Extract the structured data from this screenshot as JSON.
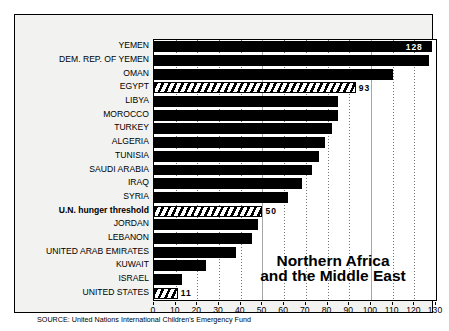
{
  "chart_data": {
    "type": "bar",
    "orientation": "horizontal",
    "title": "Northern Africa and the Middle East",
    "title_line1": "Northern Africa",
    "title_line2": "and the Middle East",
    "xlabel": "",
    "ylabel": "",
    "xlim": [
      0,
      130
    ],
    "xticks": [
      0,
      10,
      20,
      30,
      40,
      50,
      60,
      70,
      80,
      90,
      100,
      110,
      120,
      130
    ],
    "xtick_labels": [
      "0",
      "10",
      "20",
      "30",
      "40",
      "50",
      "60",
      "70",
      "80",
      "90",
      "100",
      "110",
      "120",
      "130"
    ],
    "grid": true,
    "legend": "none",
    "categories": [
      "YEMEN",
      "DEM. REP. OF YEMEN",
      "OMAN",
      "EGYPT",
      "LIBYA",
      "MOROCCO",
      "TURKEY",
      "ALGERIA",
      "TUNISIA",
      "SAUDI ARABIA",
      "IRAQ",
      "SYRIA",
      "U.N. hunger threshold",
      "JORDAN",
      "LEBANON",
      "UNITED ARAB EMIRATES",
      "KUWAIT",
      "ISRAEL",
      "UNITED STATES"
    ],
    "values": [
      128,
      127,
      110,
      93,
      85,
      85,
      82,
      79,
      76,
      73,
      68,
      62,
      50,
      48,
      45,
      38,
      24,
      13,
      11
    ],
    "bars": [
      {
        "label": "YEMEN",
        "value": 128,
        "style": "solid",
        "data_label": "128",
        "label_position": "inside"
      },
      {
        "label": "DEM. REP. OF YEMEN",
        "value": 127,
        "style": "solid",
        "data_label": "",
        "label_position": "none"
      },
      {
        "label": "OMAN",
        "value": 110,
        "style": "solid",
        "data_label": "",
        "label_position": "none"
      },
      {
        "label": "EGYPT",
        "value": 93,
        "style": "hatched",
        "data_label": "93",
        "label_position": "outside"
      },
      {
        "label": "LIBYA",
        "value": 85,
        "style": "solid",
        "data_label": "",
        "label_position": "none"
      },
      {
        "label": "MOROCCO",
        "value": 85,
        "style": "solid",
        "data_label": "",
        "label_position": "none"
      },
      {
        "label": "TURKEY",
        "value": 82,
        "style": "solid",
        "data_label": "",
        "label_position": "none"
      },
      {
        "label": "ALGERIA",
        "value": 79,
        "style": "solid",
        "data_label": "",
        "label_position": "none"
      },
      {
        "label": "TUNISIA",
        "value": 76,
        "style": "solid",
        "data_label": "",
        "label_position": "none"
      },
      {
        "label": "SAUDI ARABIA",
        "value": 73,
        "style": "solid",
        "data_label": "",
        "label_position": "none"
      },
      {
        "label": "IRAQ",
        "value": 68,
        "style": "solid",
        "data_label": "",
        "label_position": "none"
      },
      {
        "label": "SYRIA",
        "value": 62,
        "style": "solid",
        "data_label": "",
        "label_position": "none"
      },
      {
        "label": "U.N. hunger threshold",
        "value": 50,
        "style": "hatched",
        "data_label": "50",
        "label_position": "outside",
        "emphasis": "bold"
      },
      {
        "label": "JORDAN",
        "value": 48,
        "style": "solid",
        "data_label": "",
        "label_position": "none"
      },
      {
        "label": "LEBANON",
        "value": 45,
        "style": "solid",
        "data_label": "",
        "label_position": "none"
      },
      {
        "label": "UNITED ARAB EMIRATES",
        "value": 38,
        "style": "solid",
        "data_label": "",
        "label_position": "none"
      },
      {
        "label": "KUWAIT",
        "value": 24,
        "style": "solid",
        "data_label": "",
        "label_position": "none"
      },
      {
        "label": "ISRAEL",
        "value": 13,
        "style": "solid",
        "data_label": "",
        "label_position": "none"
      },
      {
        "label": "UNITED STATES",
        "value": 11,
        "style": "hatched",
        "data_label": "11",
        "label_position": "outside"
      }
    ],
    "annotations": [
      "Northern Africa and the Middle East"
    ]
  },
  "source": {
    "text": "SOURCE: United Nations International Children's Emergency Fund"
  },
  "map": {
    "name": "africa-map",
    "shaded_region": "Northern Africa"
  },
  "colors": {
    "bar": "#000000",
    "background": "#ffffff",
    "panel": "#f2f2f0",
    "text": "#000000"
  }
}
